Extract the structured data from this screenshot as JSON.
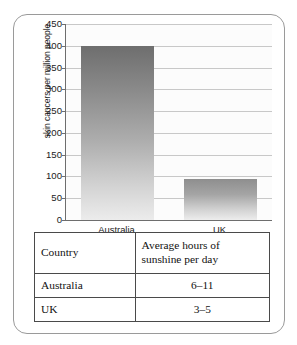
{
  "chart_data": {
    "type": "bar",
    "title": "",
    "xlabel": "",
    "ylabel": "skin cancers per million people",
    "categories": [
      "Australia",
      "UK"
    ],
    "values": [
      400,
      95
    ],
    "ylim": [
      0,
      450
    ],
    "ytick_step": 50,
    "yticks": [
      450,
      400,
      350,
      300,
      250,
      200,
      150,
      100,
      50,
      0
    ],
    "ytick_labels": [
      "450",
      "400",
      "350",
      "300",
      "250",
      "200",
      "150",
      "100",
      "50",
      "0"
    ],
    "grid": true,
    "legend": false,
    "legend_position": "none",
    "bar_color_top": "#6e6e6e",
    "bar_color_bottom": "#ececec",
    "axis_color": "#6e6e6e",
    "gridline_color": "#c8c8c8",
    "plot_background": "#fcfcfc"
  },
  "table": {
    "headers": [
      "Country",
      "Average hours of sunshine per day"
    ],
    "header_lines": [
      [
        "Country"
      ],
      [
        "Average hours of",
        "sunshine per day"
      ]
    ],
    "rows": [
      {
        "country": "Australia",
        "sunshine": "6–11"
      },
      {
        "country": "UK",
        "sunshine": "3–5"
      }
    ],
    "border_color": "#4a4a4a"
  },
  "frame": {
    "border_color": "#9a9a9a"
  }
}
